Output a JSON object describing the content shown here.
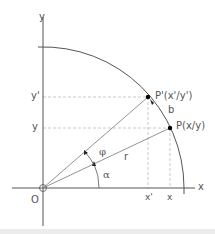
{
  "diagram": {
    "title": "",
    "colors": {
      "axis": "#555555",
      "line": "#777777",
      "dashed": "#bbbbbb",
      "point": "#000000",
      "text": "#555555",
      "band": "#ececec"
    },
    "labels": {
      "x_axis": "x",
      "y_axis": "y",
      "origin": "O",
      "point_p": "P(x/y)",
      "point_p_prime": "P'(x'/y')",
      "y_tick": "y",
      "y_prime_tick": "y'",
      "x_tick": "x",
      "x_prime_tick": "x'",
      "radius": "r",
      "arc_length": "b",
      "angle_alpha": "α",
      "angle_phi": "φ"
    },
    "geometry": {
      "origin": [
        43,
        188
      ],
      "radius_px": 141,
      "point_p": [
        170,
        128
      ],
      "point_p_prime": [
        148,
        97
      ]
    }
  }
}
